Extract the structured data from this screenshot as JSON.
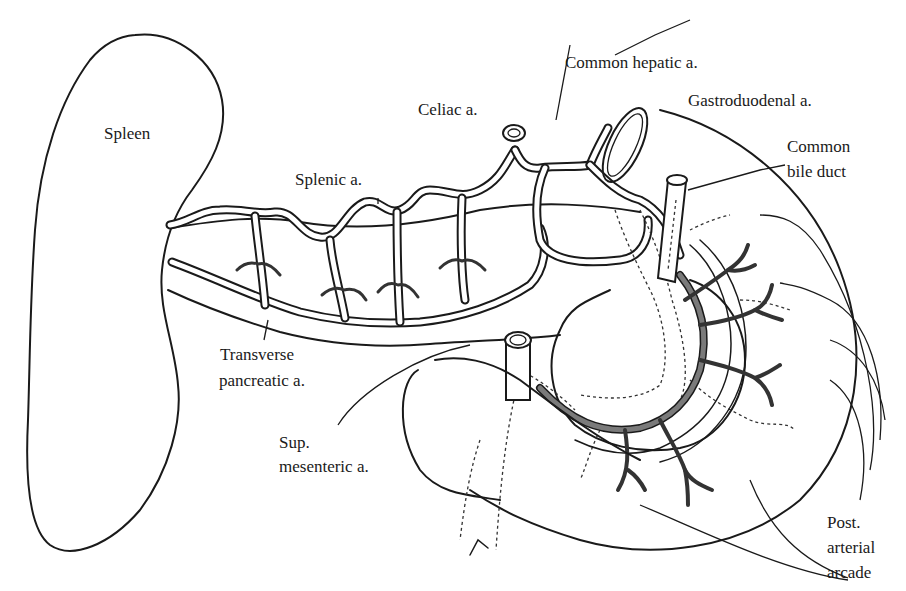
{
  "diagram": {
    "labels": {
      "spleen": "Spleen",
      "splenic_a": "Splenic a.",
      "celiac_a": "Celiac a.",
      "common_hepatic_a": "Common hepatic a.",
      "gastroduodenal_a": "Gastroduodenal a.",
      "common_bile_duct_line1": "Common",
      "common_bile_duct_line2": "bile duct",
      "transverse_pancreatic_a_line1": "Transverse",
      "transverse_pancreatic_a_line2": "pancreatic a.",
      "sup_mesenteric_a_line1": "Sup.",
      "sup_mesenteric_a_line2": "mesenteric a.",
      "post_arterial_arcade_line1": "Post.",
      "post_arterial_arcade_line2": "arterial",
      "post_arterial_arcade_line3": "arcade"
    },
    "colors": {
      "line": "#1a1a1a",
      "arcade_fill": "#7a7a7a",
      "background": "#ffffff"
    }
  }
}
